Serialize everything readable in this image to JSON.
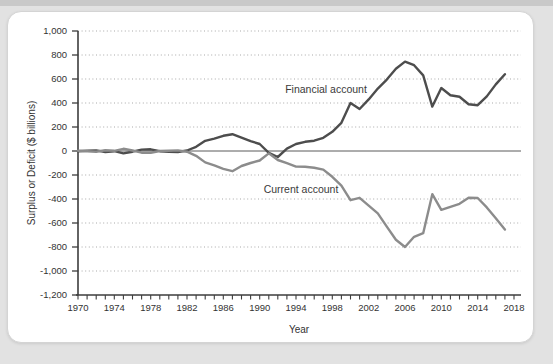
{
  "chart_data": {
    "type": "line",
    "title": "",
    "xlabel": "Year",
    "ylabel": "Surplus or Deficit ($ billions)",
    "x_start": 1970,
    "x_axis_end": 2018,
    "x_tick_every_years": 1,
    "x_tick_labels": [
      1970,
      1974,
      1978,
      1982,
      1986,
      1990,
      1994,
      1998,
      2002,
      2006,
      2010,
      2014,
      2018
    ],
    "ylim": [
      -1200,
      1000
    ],
    "y_ticks": [
      1000,
      800,
      600,
      400,
      200,
      0,
      -200,
      -400,
      -600,
      -800,
      -1000,
      -1200
    ],
    "grid": "dotted horizontal gridlines at every 200, solid line at zero",
    "legend": "inline text labels next to lines",
    "series": [
      {
        "name": "Financial account",
        "color": "#4d4d4d",
        "year_start": 1970,
        "values": [
          -2,
          2,
          5,
          -8,
          -2,
          -20,
          -6,
          12,
          14,
          -2,
          -6,
          -8,
          4,
          35,
          85,
          103,
          127,
          140,
          112,
          82,
          58,
          -15,
          -50,
          20,
          58,
          77,
          86,
          110,
          160,
          235,
          400,
          350,
          430,
          520,
          595,
          685,
          745,
          715,
          630,
          370,
          525,
          465,
          452,
          390,
          382,
          455,
          555,
          640
        ]
      },
      {
        "name": "Current account",
        "color": "#8c8c8c",
        "year_start": 1970,
        "values": [
          2,
          -2,
          -6,
          7,
          2,
          18,
          4,
          -14,
          -15,
          0,
          2,
          5,
          -6,
          -40,
          -95,
          -120,
          -148,
          -168,
          -125,
          -100,
          -79,
          -20,
          -75,
          -102,
          -130,
          -132,
          -140,
          -155,
          -215,
          -288,
          -410,
          -390,
          -455,
          -520,
          -630,
          -740,
          -800,
          -715,
          -685,
          -360,
          -490,
          -465,
          -440,
          -390,
          -392,
          -470,
          -560,
          -655
        ]
      }
    ],
    "colors": {
      "financial_line": "#4d4d4d",
      "current_line": "#8c8c8c",
      "gridline": "#a9a9a9",
      "axis": "#3d3d3d",
      "text": "#333333",
      "card_background": "#ffffff",
      "page_background": "#e2e2e2"
    }
  }
}
